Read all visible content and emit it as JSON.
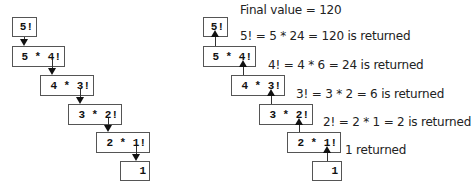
{
  "left_diagram": {
    "boxes": [
      "5!",
      "5 * 4!",
      "4 * 3!",
      "3 * 2!",
      "2 * 1!",
      "1"
    ],
    "arrow_direction": "down"
  },
  "right_diagram": {
    "boxes": [
      "5!",
      "5 * 4!",
      "4 * 3!",
      "3 * 2!",
      "2 * 1!",
      "1"
    ],
    "arrow_direction": "up",
    "labels": [
      "Final value = 120",
      "5! = 5 * 24 = 120 is returned",
      "4! = 4 * 6 = 24 is returned",
      "3! = 3 * 2 = 6 is returned",
      "2! = 2 * 1 = 2 is returned",
      "1 returned"
    ]
  }
}
